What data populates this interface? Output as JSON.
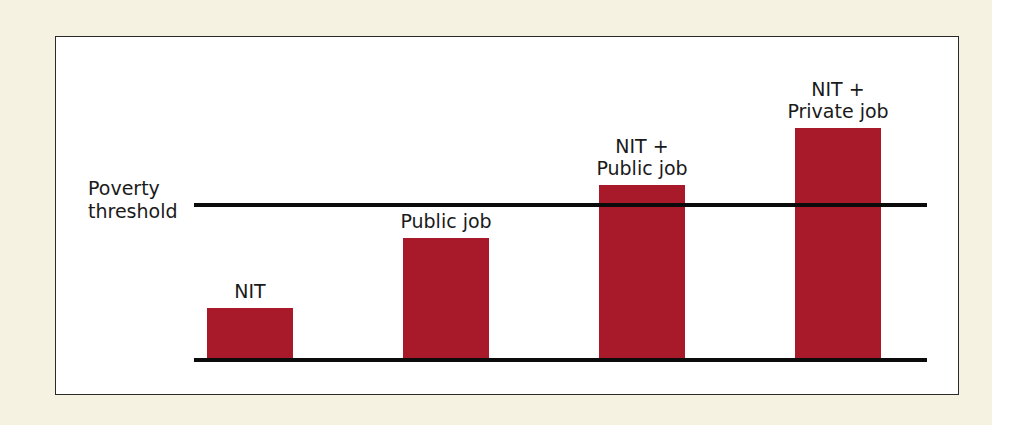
{
  "chart_data": {
    "type": "bar",
    "title": "",
    "xlabel": "",
    "ylabel": "",
    "categories": [
      "NIT",
      "Public job",
      "NIT + Public job",
      "NIT + Private job"
    ],
    "category_label_lines": [
      [
        "NIT"
      ],
      [
        "Public job"
      ],
      [
        "NIT +",
        "Public job"
      ],
      [
        "NIT +",
        "Private job"
      ]
    ],
    "values": [
      21,
      49,
      70,
      93
    ],
    "value_units": "relative income (% of plot height; poverty threshold = 62)",
    "reference_line": {
      "label": "Poverty threshold",
      "label_lines": [
        "Poverty",
        "threshold"
      ],
      "value": 62
    },
    "ylim": [
      0,
      100
    ],
    "grid": false,
    "legend": null,
    "axes_ticks": false,
    "bar_color": "#a8192a"
  },
  "colors": {
    "background": "#f6f2e1",
    "panel": "#ffffff",
    "bar": "#a8192a",
    "line": "#0b0b0b"
  }
}
